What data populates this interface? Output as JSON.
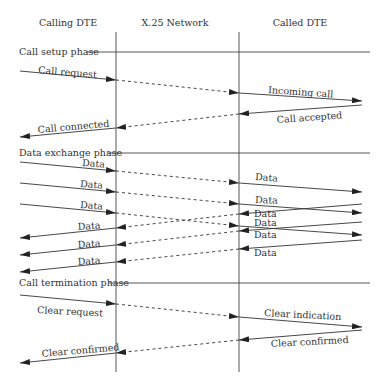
{
  "headers": {
    "calling": "Calling DTE",
    "network": "X.25 Network",
    "called": "Called DTE"
  },
  "phases": {
    "setup": "Call setup phase",
    "data": "Data exchange phase",
    "termination": "Call termination phase"
  },
  "messages": {
    "call_request": "Call request",
    "incoming_call": "Incoming call",
    "call_accepted": "Call accepted",
    "call_connected": "Call connected",
    "data": "Data",
    "clear_request": "Clear request",
    "clear_indication": "Clear indication",
    "clear_confirmed_called": "Clear confirmed",
    "clear_confirmed_calling": "Clear confirmed"
  },
  "colors": {
    "line": "#333333",
    "background": "#ffffff"
  }
}
